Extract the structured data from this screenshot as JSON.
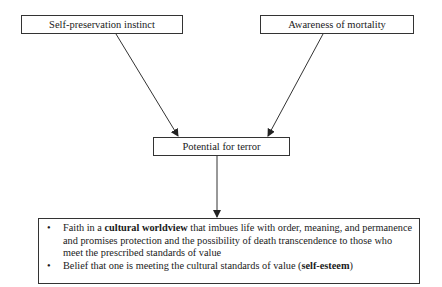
{
  "diagram": {
    "nodes": {
      "self_preservation": "Self-preservation instinct",
      "awareness": "Awareness of mortality",
      "terror": "Potential for terror"
    },
    "buffer": {
      "item1": {
        "pre": "Faith in a ",
        "bold": "cultural worldview",
        "post": " that imbues life with order, meaning, and permanence and promises protection and the possibility of death transcendence to those who meet the prescribed standards of value"
      },
      "item2": {
        "pre": "Belief that one is meeting the cultural standards of value (",
        "bold": "self-esteem",
        "post": ")"
      }
    },
    "edges": [
      {
        "from": "Self-preservation instinct",
        "to": "Potential for terror"
      },
      {
        "from": "Awareness of mortality",
        "to": "Potential for terror"
      },
      {
        "from": "Potential for terror",
        "to": "buffer"
      }
    ],
    "colors": {
      "line": "#333333",
      "background": "#ffffff"
    }
  }
}
